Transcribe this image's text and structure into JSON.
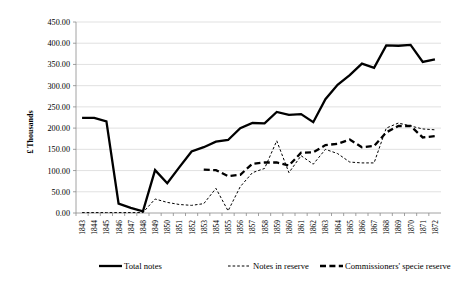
{
  "chart_data": {
    "type": "line",
    "title": "",
    "xlabel": "",
    "ylabel": "£ Thousands",
    "ylim": [
      0,
      450
    ],
    "ytick_step": 50,
    "ytick_labels": [
      "0.00",
      "50.00",
      "100.00",
      "150.00",
      "200.00",
      "250.00",
      "300.00",
      "350.00",
      "400.00",
      "450.00"
    ],
    "grid": true,
    "legend_position": "bottom",
    "categories": [
      1843,
      1844,
      1845,
      1846,
      1847,
      1848,
      1849,
      1850,
      1851,
      1852,
      1853,
      1854,
      1855,
      1856,
      1857,
      1858,
      1859,
      1860,
      1861,
      1862,
      1863,
      1864,
      1865,
      1866,
      1867,
      1868,
      1869,
      1870,
      1871,
      1872
    ],
    "xtick_labels": [
      "1843",
      "1844",
      "1845",
      "1846",
      "1847",
      "1848",
      "1849",
      "1850",
      "1851",
      "1852",
      "1853",
      "1854",
      "1855",
      "1856",
      "1857",
      "1858",
      "1859",
      "1860",
      "1861",
      "1862",
      "1863",
      "1864",
      "1865",
      "1866",
      "1867",
      "1868",
      "1869",
      "1870",
      "1871",
      "1872"
    ],
    "series": [
      {
        "name": "Total notes",
        "style": "solid",
        "values": [
          224,
          224,
          216,
          22,
          12,
          4,
          101,
          70,
          108,
          145,
          155,
          168,
          172,
          200,
          212,
          211,
          238,
          231,
          233,
          214,
          268,
          302,
          325,
          352,
          342,
          395,
          394,
          396,
          356,
          362
        ]
      },
      {
        "name": "Notes in reserve",
        "style": "dotted",
        "values": [
          1,
          1,
          1,
          1,
          1,
          1,
          33,
          25,
          20,
          18,
          22,
          58,
          5,
          62,
          95,
          105,
          170,
          95,
          135,
          115,
          150,
          140,
          120,
          118,
          118,
          200,
          212,
          205,
          198,
          196
        ]
      },
      {
        "name": "Commissioners' specie reserve",
        "style": "dashed",
        "values": [
          null,
          null,
          null,
          null,
          null,
          null,
          null,
          null,
          null,
          null,
          102,
          101,
          87,
          90,
          116,
          119,
          119,
          112,
          142,
          143,
          160,
          163,
          173,
          155,
          158,
          190,
          205,
          205,
          178,
          181
        ]
      }
    ]
  },
  "legend": [
    {
      "label": "Total notes",
      "style": "solid"
    },
    {
      "label": "Notes in reserve",
      "style": "dotted"
    },
    {
      "label": "Commissioners' specie reserve",
      "style": "dashed"
    }
  ]
}
